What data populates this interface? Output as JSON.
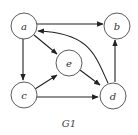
{
  "diagram": {
    "type": "directed-graph",
    "caption": "G1",
    "nodes": [
      {
        "id": "a",
        "label": "a"
      },
      {
        "id": "b",
        "label": "b"
      },
      {
        "id": "c",
        "label": "c"
      },
      {
        "id": "d",
        "label": "d"
      },
      {
        "id": "e",
        "label": "e"
      }
    ],
    "edges": [
      {
        "from": "a",
        "to": "b"
      },
      {
        "from": "a",
        "to": "e"
      },
      {
        "from": "a",
        "to": "c"
      },
      {
        "from": "c",
        "to": "e"
      },
      {
        "from": "c",
        "to": "d"
      },
      {
        "from": "e",
        "to": "d"
      },
      {
        "from": "d",
        "to": "b"
      },
      {
        "from": "d",
        "to": "a",
        "curved": true
      }
    ]
  }
}
